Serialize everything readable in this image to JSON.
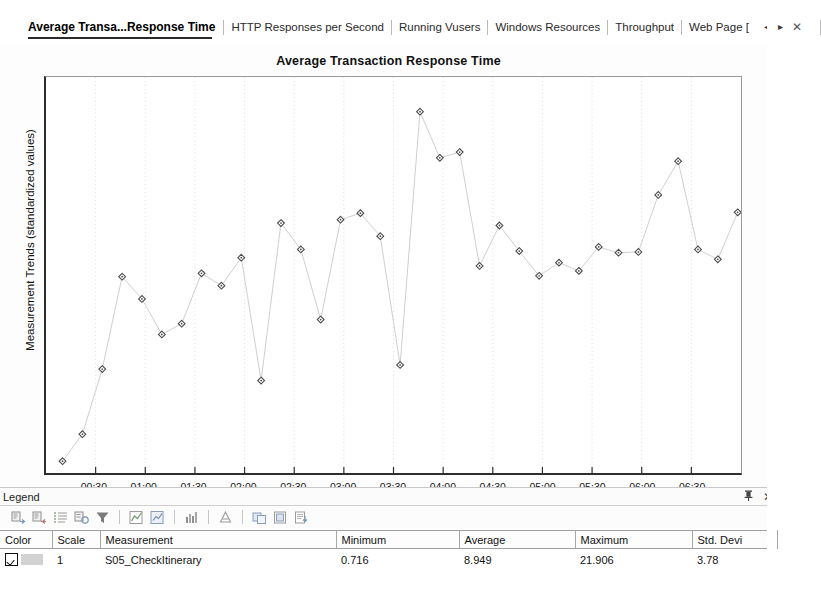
{
  "tabs": {
    "items": [
      {
        "label": "Average Transa...Response Time",
        "active": true
      },
      {
        "label": "HTTP Responses per Second",
        "active": false
      },
      {
        "label": "Running Vusers",
        "active": false
      },
      {
        "label": "Windows Resources",
        "active": false
      },
      {
        "label": "Throughput",
        "active": false
      },
      {
        "label": "Web Page [",
        "active": false
      }
    ],
    "nav": {
      "prev": "◂",
      "next": "▸",
      "close": "✕"
    }
  },
  "chart_data": {
    "type": "line",
    "title": "Average Transaction Response Time",
    "xlabel": "Elapsed scenario time mm:ss",
    "ylabel": "Measurement Trends (standardized values)",
    "grid": "vertical-dotted",
    "legend_position": "bottom-table",
    "marker": "diamond",
    "xtick_labels": [
      "00:30",
      "01:00",
      "01:30",
      "02:00",
      "02:30",
      "03:00",
      "03:30",
      "04:00",
      "04:30",
      "05:00",
      "05:30",
      "06:00",
      "06:30"
    ],
    "ytick_labels": [],
    "xlim": [
      0,
      420
    ],
    "ylim": [
      0,
      24
    ],
    "series": [
      {
        "name": "S05_CheckItinerary",
        "x": [
          10,
          22,
          34,
          46,
          58,
          70,
          82,
          94,
          106,
          118,
          130,
          142,
          154,
          166,
          178,
          190,
          202,
          214,
          226,
          238,
          250,
          262,
          274,
          286,
          298,
          310,
          322,
          334,
          346,
          358,
          370,
          382,
          394,
          406,
          418
        ],
        "values": [
          0.716,
          2.35,
          6.3,
          11.9,
          10.55,
          8.4,
          9.05,
          12.1,
          11.35,
          13.05,
          5.6,
          15.15,
          13.55,
          9.3,
          15.35,
          15.75,
          14.35,
          6.55,
          21.9,
          19.1,
          19.45,
          12.55,
          15.0,
          13.45,
          11.95,
          12.75,
          12.25,
          13.7,
          13.35,
          13.4,
          16.85,
          18.9,
          13.55,
          12.95,
          15.8
        ]
      }
    ]
  },
  "legend": {
    "caption": "Legend",
    "pin_title": "auto-hide",
    "close_title": "close",
    "toolbar": [
      {
        "icon": "show-measurement-icon"
      },
      {
        "icon": "hide-measurement-icon"
      },
      {
        "icon": "configure-measurements-icon"
      },
      {
        "icon": "measurement-options-icon"
      },
      {
        "icon": "filter-icon"
      },
      {
        "icon": "show-trend-icon"
      },
      {
        "icon": "auto-correlate-icon"
      },
      {
        "icon": "bar-chart-icon"
      },
      {
        "icon": "granularity-icon"
      },
      {
        "icon": "merge-graphs-icon"
      },
      {
        "icon": "overlay-graph-icon"
      },
      {
        "icon": "export-icon"
      }
    ],
    "columns": [
      {
        "label": "Color",
        "width": "52px"
      },
      {
        "label": "Scale",
        "width": "48px"
      },
      {
        "label": "Measurement",
        "width": "236px"
      },
      {
        "label": "Minimum",
        "width": "123px"
      },
      {
        "label": "Average",
        "width": "116px"
      },
      {
        "label": "Maximum",
        "width": "117px"
      },
      {
        "label": "Std. Devi",
        "width": "85px"
      }
    ],
    "rows": [
      {
        "checked": true,
        "color": "#d2d2d2",
        "scale": "1",
        "measurement": "S05_CheckItinerary",
        "minimum": "0.716",
        "average": "8.949",
        "maximum": "21.906",
        "std_dev": "3.78"
      }
    ]
  }
}
